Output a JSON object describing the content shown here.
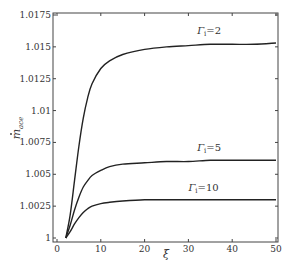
{
  "chart_data": {
    "type": "line",
    "title": "",
    "xlabel": "ξ",
    "ylabel": "ṁ_ace",
    "xlim": [
      0,
      50
    ],
    "ylim": [
      1,
      1.0175
    ],
    "grid": false,
    "legend": "inline labels",
    "xticks": [
      "0",
      "10",
      "20",
      "30",
      "40",
      "50"
    ],
    "yticks": [
      "1",
      "1.0025",
      "1.005",
      "1.0075",
      "1.01",
      "1.0125",
      "1.015",
      "1.0175"
    ],
    "series": [
      {
        "name": "Γ_i = 2",
        "label": "Γi=2",
        "x": [
          2,
          3,
          4,
          5,
          6,
          7,
          8,
          10,
          12,
          15,
          20,
          25,
          30,
          35,
          40,
          45,
          50
        ],
        "y": [
          1.0,
          1.0018,
          1.0045,
          1.0072,
          1.0094,
          1.011,
          1.0121,
          1.0133,
          1.0139,
          1.0144,
          1.0148,
          1.015,
          1.0151,
          1.0152,
          1.0152,
          1.0152,
          1.0153
        ]
      },
      {
        "name": "Γ_i = 5",
        "label": "Γi=5",
        "x": [
          2,
          3,
          4,
          5,
          6,
          7,
          8,
          10,
          12,
          15,
          20,
          25,
          30,
          35,
          40,
          45,
          50
        ],
        "y": [
          1.0,
          1.001,
          1.0022,
          1.0032,
          1.004,
          1.0045,
          1.0049,
          1.0053,
          1.0056,
          1.0058,
          1.0059,
          1.006,
          1.006,
          1.0061,
          1.0061,
          1.0061,
          1.0061
        ]
      },
      {
        "name": "Γ_i = 10",
        "label": "Γi=10",
        "x": [
          2,
          3,
          4,
          5,
          6,
          7,
          8,
          10,
          12,
          15,
          20,
          25,
          30,
          35,
          40,
          45,
          50
        ],
        "y": [
          1.0,
          1.0005,
          1.0011,
          1.0016,
          1.002,
          1.0023,
          1.0025,
          1.0027,
          1.0028,
          1.0029,
          1.003,
          1.003,
          1.003,
          1.003,
          1.003,
          1.003,
          1.003
        ]
      }
    ],
    "annotations": [
      {
        "text": "Γi=2",
        "x": 32,
        "y": 1.016
      },
      {
        "text": "Γi=5",
        "x": 32,
        "y": 1.0068
      },
      {
        "text": "Γi=10",
        "x": 30,
        "y": 1.0037
      }
    ]
  },
  "axes": {
    "xlabel": "ξ",
    "ylabel_main": "m",
    "ylabel_sub": "ace"
  }
}
